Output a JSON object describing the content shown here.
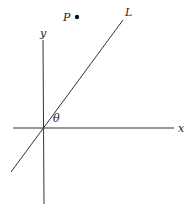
{
  "diagram": {
    "labels": {
      "x_axis": "x",
      "y_axis": "y",
      "line": "L",
      "point": "P",
      "angle": "θ"
    },
    "colors": {
      "stroke": "#333333",
      "point": "#111111"
    }
  }
}
